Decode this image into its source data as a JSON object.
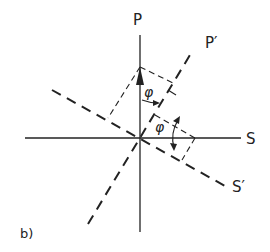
{
  "diagram": {
    "panel_label": "b)",
    "axes": {
      "p_label": "P",
      "p_prime_label": "P′",
      "s_label": "S",
      "s_prime_label": "S′"
    },
    "angles": {
      "upper_angle": "φ",
      "lower_angle": "φ"
    },
    "colors": {
      "stroke": "#222222",
      "background": "#ffffff"
    }
  }
}
